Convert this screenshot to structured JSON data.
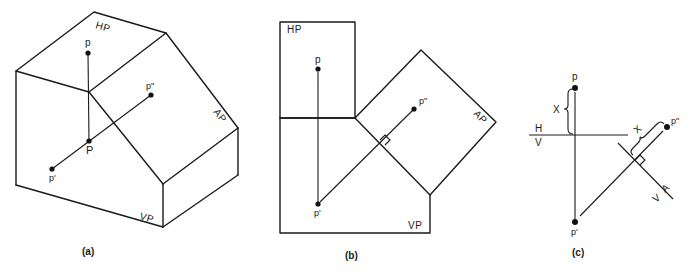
{
  "figure": {
    "panels": [
      {
        "id": "a",
        "caption": "(a)",
        "planes": {
          "hp": "HP",
          "vp": "VP",
          "ap": "AP"
        },
        "points": {
          "p_top": "p",
          "p_space": "P",
          "p_front": "p'",
          "p_aux": "p\""
        }
      },
      {
        "id": "b",
        "caption": "(b)",
        "planes": {
          "hp": "HP",
          "vp": "VP",
          "ap": "AP"
        },
        "points": {
          "p_top": "p",
          "p_front": "p'",
          "p_aux": "p\""
        }
      },
      {
        "id": "c",
        "caption": "(c)",
        "fold_lines": {
          "hv_top": "H",
          "hv_bottom": "V",
          "av_top": "A",
          "av_bottom": "V"
        },
        "dimension": "X",
        "points": {
          "p_top": "p",
          "p_front": "p'",
          "p_aux": "p\""
        }
      }
    ]
  }
}
